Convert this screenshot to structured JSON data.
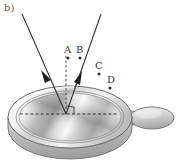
{
  "figure": {
    "panel_label": "b)",
    "background_color": "#ffffff",
    "width": 177,
    "height": 161
  },
  "labels": [
    {
      "id": "A",
      "text": "A",
      "x": 64,
      "y": 45,
      "dot_x": 68,
      "dot_y": 58
    },
    {
      "id": "B",
      "text": "B",
      "x": 76,
      "y": 45,
      "dot_x": 80,
      "dot_y": 58
    },
    {
      "id": "C",
      "text": "C",
      "x": 95,
      "y": 61,
      "dot_x": 99,
      "dot_y": 74
    },
    {
      "id": "D",
      "text": "D",
      "x": 107,
      "y": 75,
      "dot_x": 110,
      "dot_y": 88
    }
  ],
  "rays": {
    "incident": {
      "name": "incident-ray",
      "from_x": 22,
      "from_y": 14,
      "to_x": 66,
      "to_y": 114,
      "arrow_x": 46,
      "arrow_y": 70,
      "color": "#333333"
    },
    "reflected": {
      "name": "reflected-ray",
      "from_x": 66,
      "from_y": 114,
      "to_x": 101,
      "to_y": 14,
      "arrow_x": 78,
      "arrow_y": 78,
      "color": "#333333"
    },
    "normal": {
      "name": "normal-line",
      "x": 66,
      "from_y": 56,
      "to_y": 114,
      "color": "#444444",
      "style": "dashed"
    },
    "axis": {
      "name": "optical-axis",
      "from_x": 20,
      "from_y": 114,
      "to_x": 118,
      "to_y": 114,
      "color": "#333333",
      "style": "dashed"
    },
    "right_angle": {
      "name": "right-angle-marker",
      "x": 66,
      "y": 114,
      "size": 8
    }
  },
  "pan": {
    "name": "frying-pan",
    "center_x": 70,
    "center_y": 117,
    "rim_rx": 62,
    "rim_ry": 31,
    "body_depth": 14,
    "colors": {
      "rim_light": "#f2f2f2",
      "rim_mid": "#c8c8c8",
      "rim_dark": "#9a9a9a",
      "body_shadow": "#b5b5b5",
      "surface_light": "#fbfbfb",
      "surface_dark": "#8d8d8d",
      "outline": "#6f6f6f"
    },
    "handle": {
      "name": "pan-handle",
      "neck_x": 128,
      "neck_y": 118,
      "grip_cx": 152,
      "grip_cy": 117,
      "grip_rx": 22,
      "grip_ry": 11
    }
  }
}
